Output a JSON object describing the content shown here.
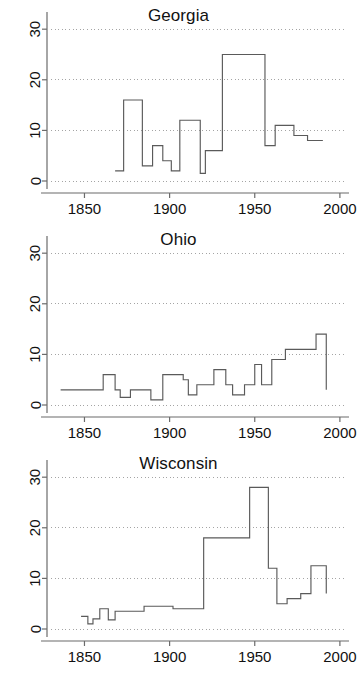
{
  "figure": {
    "background": "#ffffff",
    "line_color": "#5a5a5a",
    "axis_color": "#6b6b6b",
    "grid_color": "#9a9a9a",
    "text_color": "#111111"
  },
  "chart_data": [
    {
      "type": "line",
      "subtype": "step",
      "title": "Georgia",
      "xlabel": "",
      "ylabel": "",
      "xlim": [
        1828,
        2003
      ],
      "ylim": [
        0,
        33
      ],
      "xticks": [
        1850,
        1900,
        1950,
        2000
      ],
      "yticks": [
        0,
        10,
        20,
        30
      ],
      "grid": true,
      "grid_axis": "y",
      "legend": "none",
      "x": [
        1868,
        1873,
        1884,
        1890,
        1896,
        1901,
        1906,
        1909,
        1918,
        1921,
        1924,
        1931,
        1956,
        1962,
        1973,
        1981,
        1990
      ],
      "values": [
        2,
        16,
        3,
        7,
        4,
        2,
        12,
        12,
        1.5,
        6,
        6,
        25,
        7,
        11,
        9,
        8,
        8
      ]
    },
    {
      "type": "line",
      "subtype": "step",
      "title": "Ohio",
      "xlabel": "",
      "ylabel": "",
      "xlim": [
        1828,
        2003
      ],
      "ylim": [
        0,
        33
      ],
      "xticks": [
        1850,
        1900,
        1950,
        2000
      ],
      "yticks": [
        0,
        10,
        20,
        30
      ],
      "grid": true,
      "grid_axis": "y",
      "legend": "none",
      "x": [
        1836,
        1856,
        1861,
        1868,
        1871,
        1877,
        1886,
        1889,
        1892,
        1896,
        1903,
        1908,
        1911,
        1916,
        1920,
        1926,
        1933,
        1937,
        1944,
        1950,
        1954,
        1960,
        1968,
        1976,
        1986,
        1992
      ],
      "values": [
        3,
        3,
        6,
        3,
        1.5,
        3,
        3,
        1,
        1,
        6,
        6,
        5,
        2,
        4,
        4,
        7,
        4,
        2,
        4,
        8,
        4,
        9,
        11,
        11,
        14,
        3
      ]
    },
    {
      "type": "line",
      "subtype": "step",
      "title": "Wisconsin",
      "xlabel": "",
      "ylabel": "",
      "xlim": [
        1828,
        2003
      ],
      "ylim": [
        0,
        33
      ],
      "xticks": [
        1850,
        1900,
        1950,
        2000
      ],
      "yticks": [
        0,
        10,
        20,
        30
      ],
      "grid": true,
      "grid_axis": "y",
      "legend": "none",
      "x": [
        1848,
        1852,
        1855,
        1859,
        1864,
        1868,
        1880,
        1885,
        1902,
        1920,
        1947,
        1958,
        1963,
        1969,
        1977,
        1983,
        1992
      ],
      "values": [
        2.5,
        1,
        2,
        4,
        1.8,
        3.5,
        3.5,
        4.5,
        4,
        18,
        28,
        12,
        5,
        6,
        7,
        12.5,
        7
      ]
    }
  ]
}
